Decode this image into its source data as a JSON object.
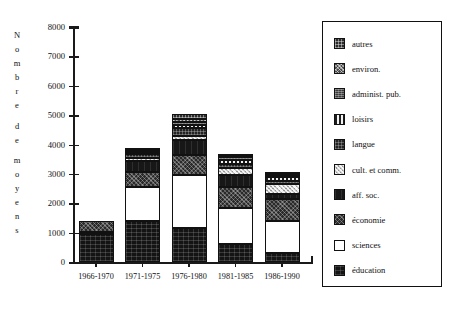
{
  "chart_data": {
    "type": "bar",
    "stacked": true,
    "title": "",
    "xlabel": "",
    "ylabel": "Nombre de moyens",
    "ylim": [
      0,
      8000
    ],
    "ytick_values": [
      0,
      1000,
      2000,
      3000,
      4000,
      5000,
      6000,
      7000,
      8000
    ],
    "ytick_labels": [
      "0",
      "1000",
      "2000",
      "3000",
      "4000",
      "5000",
      "6000",
      "7000",
      "8000"
    ],
    "grid": false,
    "legend_position": "right",
    "categories": [
      "1966-1970",
      "1971-1975",
      "1976-1980",
      "1981-1985",
      "1986-1990"
    ],
    "series": [
      {
        "name": "éducation",
        "pattern": "p-education",
        "values": [
          950,
          1400,
          1150,
          600,
          300
        ]
      },
      {
        "name": "sciences",
        "pattern": "p-sciences",
        "values": [
          80,
          1150,
          1800,
          1250,
          1100
        ]
      },
      {
        "name": "économie",
        "pattern": "p-economie",
        "values": [
          380,
          500,
          700,
          700,
          750
        ]
      },
      {
        "name": "aff. soc.",
        "pattern": "p-affsoc",
        "values": [
          0,
          400,
          500,
          400,
          150
        ]
      },
      {
        "name": "cult. et comm.",
        "pattern": "p-cult",
        "values": [
          0,
          80,
          150,
          250,
          350
        ]
      },
      {
        "name": "langue",
        "pattern": "p-langue",
        "values": [
          0,
          150,
          250,
          150,
          100
        ]
      },
      {
        "name": "loisirs",
        "pattern": "p-loisirs",
        "values": [
          0,
          60,
          130,
          130,
          130
        ]
      },
      {
        "name": "administ. pub.",
        "pattern": "p-admin",
        "values": [
          0,
          60,
          100,
          80,
          80
        ]
      },
      {
        "name": "environ.",
        "pattern": "p-environ",
        "values": [
          0,
          30,
          80,
          60,
          40
        ]
      },
      {
        "name": "autres",
        "pattern": "p-autres",
        "values": [
          0,
          50,
          180,
          60,
          40
        ]
      }
    ],
    "totals": [
      1410,
      3880,
      5040,
      3680,
      3040
    ]
  },
  "axis": {
    "y_title_chars": [
      "N",
      "o",
      "m",
      "b",
      "r",
      "e",
      "",
      "d",
      "e",
      "",
      "m",
      "o",
      "y",
      "e",
      "n",
      "s"
    ]
  },
  "legend": {
    "items": [
      {
        "label": "autres",
        "pattern": "p-autres"
      },
      {
        "label": "environ.",
        "pattern": "p-environ"
      },
      {
        "label": "administ. pub.",
        "pattern": "p-admin"
      },
      {
        "label": "loisirs",
        "pattern": "p-loisirs"
      },
      {
        "label": "langue",
        "pattern": "p-langue"
      },
      {
        "label": "cult. et comm.",
        "pattern": "p-cult"
      },
      {
        "label": "aff. soc.",
        "pattern": "p-affsoc"
      },
      {
        "label": "économie",
        "pattern": "p-economie"
      },
      {
        "label": "sciences",
        "pattern": "p-sciences"
      },
      {
        "label": "éducation",
        "pattern": "p-education"
      }
    ]
  },
  "colors": {
    "axis": "#1a1a1a",
    "frame": "#111111",
    "background": "#ffffff"
  }
}
